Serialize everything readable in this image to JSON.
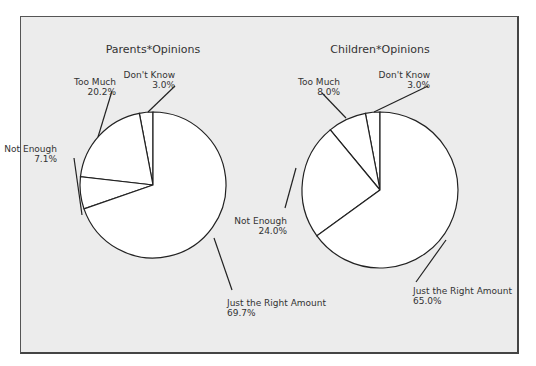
{
  "chart_data": [
    {
      "type": "pie",
      "title": "Parents*Opinions",
      "slices": [
        {
          "label": "Don't Know",
          "value": 3.0,
          "display": "3.0%"
        },
        {
          "label": "Too Much",
          "value": 20.2,
          "display": "20.2%"
        },
        {
          "label": "Not Enough",
          "value": 7.1,
          "display": "7.1%"
        },
        {
          "label": "Just the Right Amount",
          "value": 69.7,
          "display": "69.7%"
        }
      ]
    },
    {
      "type": "pie",
      "title": "Children*Opinions",
      "slices": [
        {
          "label": "Don't Know",
          "value": 3.0,
          "display": "3.0%"
        },
        {
          "label": "Too Much",
          "value": 8.0,
          "display": "8.0%"
        },
        {
          "label": "Not Enough",
          "value": 24.0,
          "display": "24.0%"
        },
        {
          "label": "Just the Right Amount",
          "value": 65.0,
          "display": "65.0%"
        }
      ]
    }
  ],
  "style": {
    "slice_fill": "#ffffff",
    "stroke": "#222222",
    "background": "#ececec"
  }
}
